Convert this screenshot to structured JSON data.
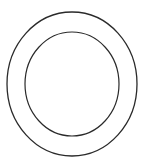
{
  "figure": {
    "stroke_color": "#2a2a2a",
    "background": "#ffffff",
    "outer_ellipse": {
      "cx": 72,
      "cy": 84,
      "rx": 65,
      "ry": 72,
      "stroke_width": 1.3
    },
    "inner_ellipse": {
      "cx": 72,
      "cy": 84,
      "rx": 47,
      "ry": 52,
      "stroke_width": 1.2
    }
  }
}
